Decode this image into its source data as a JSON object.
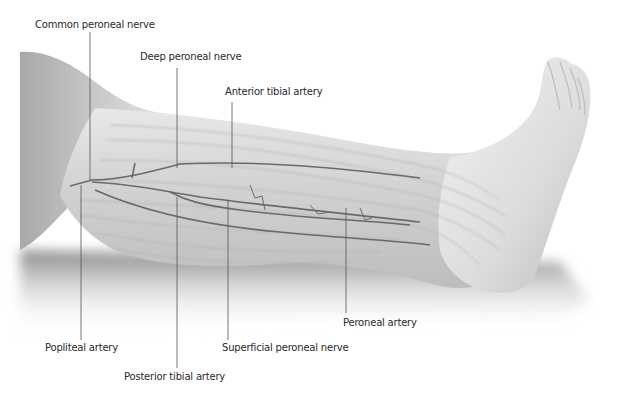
{
  "figure": {
    "palette": {
      "background": "#ffffff",
      "skin_light": "#efefef",
      "skin_mid": "#cfcfcf",
      "skin_dark": "#9a9a9a",
      "vessel": "#6a6a6a",
      "leader_line": "#555555",
      "label_text": "#2a2a2a"
    }
  },
  "labels": {
    "common_peroneal_nerve": "Common peroneal nerve",
    "deep_peroneal_nerve": "Deep peroneal nerve",
    "anterior_tibial_artery": "Anterior tibial artery",
    "popliteal_artery": "Popliteal artery",
    "posterior_tibial_artery": "Posterior tibial artery",
    "superficial_peroneal_nerve": "Superficial peroneal nerve",
    "peroneal_artery": "Peroneal artery"
  }
}
